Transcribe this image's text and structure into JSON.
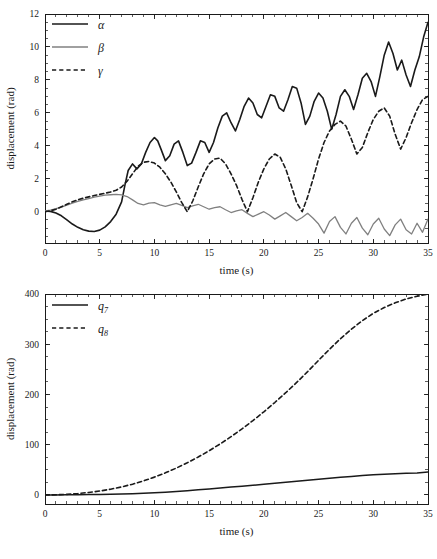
{
  "figure": {
    "width": 437,
    "height": 559,
    "background": "#ffffff",
    "line_color_primary": "#1a1a1a",
    "line_color_secondary": "#808080"
  },
  "chart_data": [
    {
      "id": "top",
      "type": "line",
      "title": "",
      "xlabel": "time (s)",
      "ylabel": "displacement (rad)",
      "xlim": [
        0,
        35
      ],
      "ylim": [
        -1.9,
        12
      ],
      "xticks": [
        0,
        5,
        10,
        15,
        20,
        25,
        30,
        35
      ],
      "yticks": [
        0,
        2,
        4,
        6,
        8,
        10,
        12
      ],
      "xtick_labels": [
        "0",
        "5",
        "10",
        "15",
        "20",
        "25",
        "30",
        "35"
      ],
      "ytick_labels": [
        "0",
        "2",
        "4",
        "6",
        "8",
        "10",
        "12"
      ],
      "minor_tick_step_x": 1,
      "minor_tick_step_y": 0.5,
      "grid": false,
      "legend_position": "upper left",
      "legend": [
        {
          "label": "α",
          "color": "#1a1a1a",
          "dash": "none",
          "width": 1.6
        },
        {
          "label": "β",
          "color": "#808080",
          "dash": "none",
          "width": 1.3
        },
        {
          "label": "γ",
          "color": "#1a1a1a",
          "dash": "dashed",
          "width": 1.6
        }
      ],
      "series": [
        {
          "name": "α",
          "color": "#1a1a1a",
          "dash": "none",
          "width": 1.6,
          "x": [
            0,
            0.5,
            1,
            1.5,
            2,
            2.5,
            3,
            3.5,
            4,
            4.5,
            5,
            5.5,
            6,
            6.5,
            7,
            7.3,
            7.6,
            8,
            8.4,
            8.8,
            9.2,
            9.6,
            10,
            10.3,
            10.6,
            11,
            11.4,
            11.8,
            12.2,
            12.6,
            13,
            13.4,
            13.8,
            14.2,
            14.6,
            15,
            15.4,
            15.8,
            16.2,
            16.6,
            17,
            17.4,
            17.8,
            18.2,
            18.6,
            19,
            19.4,
            19.8,
            20.2,
            20.6,
            21,
            21.4,
            21.8,
            22.2,
            22.6,
            23,
            23.4,
            23.8,
            24.2,
            24.6,
            25,
            25.4,
            25.8,
            26.2,
            26.6,
            27,
            27.4,
            27.8,
            28.2,
            28.6,
            29,
            29.4,
            29.8,
            30.2,
            30.6,
            31,
            31.4,
            31.8,
            32.2,
            32.6,
            33,
            33.4,
            33.8,
            34.2,
            34.6,
            35
          ],
          "y": [
            0.05,
            0.02,
            -0.08,
            -0.25,
            -0.5,
            -0.75,
            -0.95,
            -1.1,
            -1.18,
            -1.2,
            -1.12,
            -0.92,
            -0.6,
            -0.15,
            0.6,
            1.6,
            2.5,
            2.9,
            2.6,
            2.9,
            3.6,
            4.2,
            4.5,
            4.3,
            3.8,
            3.1,
            3.4,
            4.1,
            4.3,
            3.6,
            2.8,
            2.95,
            3.6,
            4.3,
            4.2,
            3.6,
            4.2,
            5.1,
            5.8,
            6.0,
            5.4,
            4.9,
            5.6,
            6.4,
            6.9,
            6.6,
            5.9,
            5.7,
            6.4,
            7.1,
            7.0,
            6.3,
            6.1,
            6.8,
            7.6,
            7.5,
            6.6,
            5.3,
            5.8,
            6.7,
            7.2,
            6.9,
            6.1,
            5.0,
            5.9,
            7.0,
            7.4,
            7.0,
            6.2,
            7.1,
            8.1,
            8.4,
            7.9,
            7.0,
            8.2,
            9.5,
            10.3,
            9.6,
            8.6,
            9.2,
            8.3,
            7.6,
            8.6,
            9.4,
            10.6,
            11.5,
            11.7
          ]
        },
        {
          "name": "β",
          "color": "#808080",
          "dash": "none",
          "width": 1.3,
          "x": [
            0,
            0.5,
            1,
            1.5,
            2,
            2.5,
            3,
            3.5,
            4,
            4.5,
            5,
            5.5,
            6,
            6.5,
            7,
            7.5,
            8,
            8.5,
            9,
            9.5,
            10,
            10.5,
            11,
            11.5,
            12,
            12.5,
            13,
            13.5,
            14,
            14.5,
            15,
            15.5,
            16,
            16.5,
            17,
            17.5,
            18,
            18.5,
            19,
            19.5,
            20,
            20.5,
            21,
            21.5,
            22,
            22.5,
            23,
            23.5,
            24,
            24.5,
            25,
            25.5,
            26,
            26.5,
            27,
            27.5,
            28,
            28.5,
            29,
            29.5,
            30,
            30.5,
            31,
            31.5,
            32,
            32.5,
            33,
            33.5,
            34,
            34.5,
            35
          ],
          "y": [
            0.05,
            0.1,
            0.18,
            0.28,
            0.4,
            0.52,
            0.62,
            0.72,
            0.8,
            0.88,
            0.95,
            1.0,
            1.03,
            1.05,
            1.02,
            0.92,
            0.72,
            0.5,
            0.42,
            0.52,
            0.55,
            0.42,
            0.32,
            0.42,
            0.5,
            0.38,
            0.25,
            0.35,
            0.45,
            0.3,
            0.15,
            0.25,
            0.3,
            0.12,
            -0.05,
            0.05,
            0.12,
            -0.1,
            -0.3,
            -0.15,
            0.0,
            -0.2,
            -0.45,
            -0.25,
            -0.05,
            -0.3,
            -0.55,
            -0.35,
            -0.1,
            -0.4,
            -0.75,
            -1.3,
            -0.6,
            -0.3,
            -0.95,
            -1.35,
            -0.7,
            -0.35,
            -1.0,
            -1.4,
            -0.75,
            -0.4,
            -1.05,
            -1.45,
            -0.8,
            -0.45,
            -1.1,
            -1.35,
            -0.7,
            -1.25,
            -0.45
          ]
        },
        {
          "name": "γ",
          "color": "#1a1a1a",
          "dash": "dashed",
          "width": 1.6,
          "x": [
            0,
            0.5,
            1,
            1.5,
            2,
            2.5,
            3,
            3.5,
            4,
            4.5,
            5,
            5.5,
            6,
            6.5,
            7,
            7.5,
            8,
            8.5,
            9,
            9.5,
            10,
            10.5,
            11,
            11.5,
            12,
            12.5,
            13,
            13.5,
            14,
            14.5,
            15,
            15.5,
            16,
            16.5,
            17,
            17.5,
            18,
            18.5,
            19,
            19.5,
            20,
            20.5,
            21,
            21.5,
            22,
            22.5,
            23,
            23.5,
            24,
            24.5,
            25,
            25.5,
            26,
            26.5,
            27,
            27.5,
            28,
            28.5,
            29,
            29.5,
            30,
            30.5,
            31,
            31.5,
            32,
            32.5,
            33,
            33.5,
            34,
            34.5,
            35
          ],
          "y": [
            0.0,
            0.05,
            0.15,
            0.3,
            0.45,
            0.6,
            0.72,
            0.82,
            0.9,
            0.98,
            1.05,
            1.12,
            1.2,
            1.3,
            1.5,
            1.85,
            2.3,
            2.75,
            3.0,
            3.05,
            2.95,
            2.7,
            2.3,
            1.8,
            1.2,
            0.55,
            0.0,
            0.65,
            1.5,
            2.3,
            2.9,
            3.2,
            3.25,
            2.9,
            2.3,
            1.6,
            0.75,
            0.0,
            0.85,
            1.8,
            2.6,
            3.2,
            3.5,
            3.3,
            2.6,
            1.6,
            0.55,
            0.0,
            0.9,
            2.0,
            3.2,
            4.2,
            4.9,
            5.3,
            5.5,
            5.2,
            4.4,
            3.5,
            3.9,
            4.8,
            5.6,
            6.1,
            6.3,
            5.8,
            4.7,
            3.8,
            4.5,
            5.4,
            6.2,
            6.8,
            7.0
          ]
        }
      ]
    },
    {
      "id": "bottom",
      "type": "line",
      "title": "",
      "xlabel": "time (s)",
      "ylabel": "displacement (rad)",
      "xlim": [
        0,
        35
      ],
      "ylim": [
        -18,
        400
      ],
      "xticks": [
        0,
        5,
        10,
        15,
        20,
        25,
        30,
        35
      ],
      "yticks": [
        0,
        100,
        200,
        300,
        400
      ],
      "xtick_labels": [
        "0",
        "5",
        "10",
        "15",
        "20",
        "25",
        "30",
        "35"
      ],
      "ytick_labels": [
        "0",
        "100",
        "200",
        "300",
        "400"
      ],
      "minor_tick_step_x": 1,
      "minor_tick_step_y": 25,
      "grid": false,
      "legend_position": "upper left",
      "legend": [
        {
          "label": "q",
          "sub": "7",
          "color": "#1a1a1a",
          "dash": "none",
          "width": 1.6
        },
        {
          "label": "q",
          "sub": "8",
          "color": "#1a1a1a",
          "dash": "dashed",
          "width": 1.6
        }
      ],
      "series": [
        {
          "name": "q7",
          "color": "#1a1a1a",
          "dash": "none",
          "width": 1.5,
          "x": [
            0,
            1,
            2,
            3,
            4,
            5,
            6,
            7,
            8,
            9,
            10,
            11,
            12,
            13,
            14,
            15,
            16,
            17,
            18,
            19,
            20,
            21,
            22,
            23,
            24,
            25,
            26,
            27,
            28,
            29,
            30,
            31,
            32,
            33,
            34,
            35
          ],
          "y": [
            0,
            0.1,
            0.3,
            0.5,
            0.8,
            1.0,
            1.3,
            1.8,
            2.4,
            3.2,
            4.2,
            5.4,
            6.8,
            8.4,
            10.2,
            12.0,
            13.8,
            15.6,
            17.4,
            19.3,
            21.2,
            23.2,
            25.2,
            27.2,
            29.2,
            31.2,
            33.2,
            35.0,
            36.8,
            38.5,
            40.0,
            41.3,
            42.3,
            43.0,
            43.8,
            45.5
          ]
        },
        {
          "name": "q8",
          "color": "#1a1a1a",
          "dash": "dashed",
          "width": 1.6,
          "x": [
            0,
            1,
            2,
            3,
            4,
            5,
            6,
            7,
            8,
            9,
            10,
            11,
            12,
            13,
            14,
            15,
            16,
            17,
            18,
            19,
            20,
            21,
            22,
            23,
            24,
            25,
            26,
            27,
            28,
            29,
            30,
            31,
            32,
            33,
            34,
            35
          ],
          "y": [
            0,
            0.3,
            1.2,
            2.8,
            5.0,
            7.8,
            11.5,
            16.0,
            21.5,
            28.0,
            35.5,
            44.0,
            53.5,
            64.0,
            75.5,
            88.0,
            101.5,
            116.0,
            131.5,
            148.0,
            165.5,
            184.0,
            203.5,
            224.0,
            245.5,
            268.0,
            290.0,
            311.0,
            330.0,
            347.0,
            361.5,
            373.0,
            382.5,
            390.0,
            395.5,
            400.0
          ]
        }
      ]
    }
  ]
}
